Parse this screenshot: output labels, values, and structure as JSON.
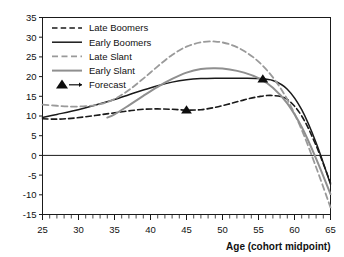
{
  "chart_data": {
    "type": "line",
    "title": "",
    "xlabel": "Age (cohort midpoint)",
    "ylabel": "",
    "xlim": [
      25,
      65
    ],
    "ylim": [
      -15,
      35
    ],
    "xticks": [
      25,
      30,
      35,
      40,
      45,
      50,
      55,
      60,
      65
    ],
    "yticks": [
      -15,
      -10,
      -5,
      0,
      5,
      10,
      15,
      20,
      25,
      30,
      35
    ],
    "xtick_labels": [
      "25",
      "30",
      "35",
      "40",
      "45",
      "50",
      "55",
      "60",
      "65"
    ],
    "ytick_labels": [
      "-15",
      "-10",
      "-5",
      "0",
      "5",
      "10",
      "15",
      "20",
      "25",
      "30",
      "35"
    ],
    "minor_xtick_step": 1,
    "grid": false,
    "zero_line": true,
    "legend_position": "top-left",
    "series": [
      {
        "name": "Late Boomers",
        "color": "#1a1a1a",
        "style": "dashed",
        "width": 1.6,
        "x": [
          25,
          27,
          29,
          31,
          33,
          35,
          37,
          39,
          41,
          43,
          45,
          47,
          49,
          51,
          53,
          55,
          57,
          59,
          61,
          63,
          65
        ],
        "y": [
          9.3,
          9.2,
          9.4,
          9.8,
          10.3,
          10.8,
          11.3,
          11.7,
          11.8,
          11.7,
          11.5,
          11.6,
          12.2,
          13.1,
          14.1,
          14.9,
          15.2,
          14.2,
          10.0,
          2.5,
          -7.0
        ]
      },
      {
        "name": "Early Boomers",
        "color": "#1a1a1a",
        "style": "solid",
        "width": 1.5,
        "x": [
          25,
          27,
          29,
          31,
          33,
          35,
          37,
          39,
          41,
          43,
          45,
          47,
          49,
          51,
          53,
          55,
          57,
          59,
          61,
          63,
          65
        ],
        "y": [
          9.6,
          10.4,
          11.2,
          12.1,
          13.1,
          14.2,
          15.4,
          16.6,
          17.7,
          18.6,
          19.2,
          19.5,
          19.6,
          19.6,
          19.6,
          19.5,
          19.0,
          16.8,
          11.6,
          3.2,
          -7.3
        ]
      },
      {
        "name": "Late Slant",
        "color": "#9a9a9a",
        "style": "dashed",
        "width": 1.8,
        "x": [
          25,
          27,
          29,
          31,
          33,
          35,
          37,
          39,
          41,
          43,
          45,
          47,
          49,
          51,
          53,
          55,
          57,
          59,
          61,
          63,
          65
        ],
        "y": [
          12.9,
          12.6,
          12.4,
          12.5,
          13.0,
          14.3,
          16.6,
          19.5,
          22.6,
          25.5,
          27.6,
          28.7,
          28.9,
          28.2,
          26.5,
          23.8,
          19.8,
          14.2,
          6.5,
          -3.0,
          -13.2
        ]
      },
      {
        "name": "Early Slant",
        "color": "#8f8f8f",
        "style": "solid",
        "width": 2.0,
        "x": [
          34,
          35,
          37,
          39,
          41,
          43,
          45,
          47,
          49,
          51,
          53,
          55,
          57,
          59,
          61,
          63,
          65
        ],
        "y": [
          9.6,
          10.4,
          12.7,
          15.1,
          17.4,
          19.4,
          21.0,
          21.9,
          22.1,
          21.8,
          21.0,
          19.6,
          17.2,
          13.2,
          7.2,
          -0.8,
          -9.8
        ]
      }
    ],
    "markers": [
      {
        "name": "Forecast",
        "shape": "triangle",
        "color": "#0d0d0d",
        "points": [
          {
            "x": 45,
            "y": 11.5
          },
          {
            "x": 55.6,
            "y": 19.4
          }
        ]
      }
    ],
    "legend": [
      {
        "label": "Late Boomers",
        "color": "#1a1a1a",
        "style": "dashed",
        "width": 1.6
      },
      {
        "label": "Early Boomers",
        "color": "#1a1a1a",
        "style": "solid",
        "width": 1.5
      },
      {
        "label": "Late Slant",
        "color": "#9a9a9a",
        "style": "dashed",
        "width": 1.8
      },
      {
        "label": "Early Slant",
        "color": "#8f8f8f",
        "style": "solid",
        "width": 2.0
      },
      {
        "label": "Forecast",
        "color": "#0d0d0d",
        "style": "marker",
        "width": 1.5
      }
    ]
  }
}
